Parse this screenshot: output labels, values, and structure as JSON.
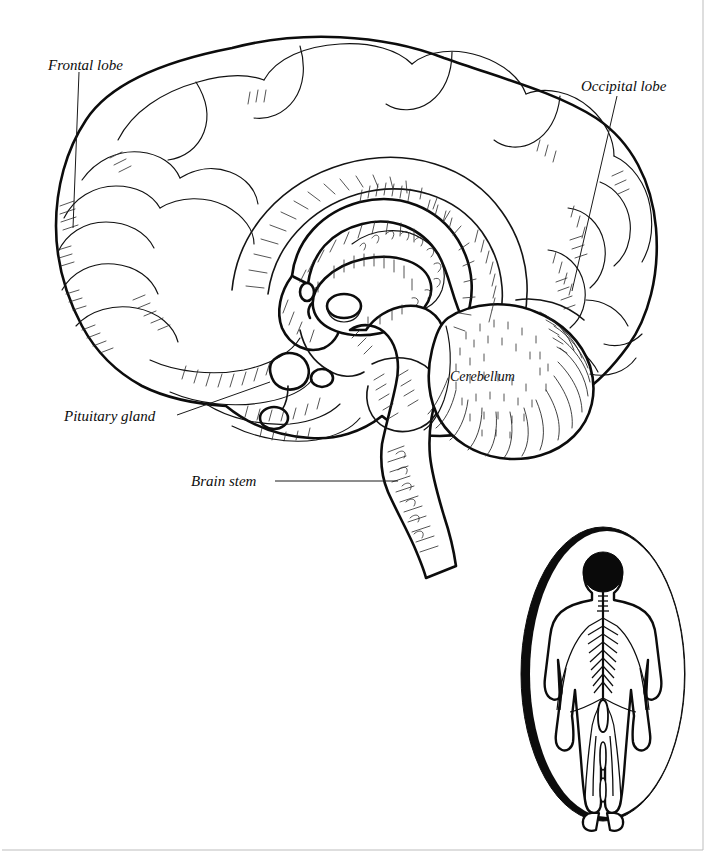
{
  "figure": {
    "background_color": "#ffffff",
    "ink_color": "#111111"
  },
  "labels": {
    "frontal_lobe": "Frontal lobe",
    "occipital_lobe": "Occipital lobe",
    "pituitary_gland": "Pituitary gland",
    "brain_stem": "Brain stem",
    "cerebellum": "Cerebellum"
  },
  "inset": {
    "name": "human-nervous-system-inset",
    "description": "Human figure showing brain and spinal cord inside an oval frame",
    "head_fill": "#0a0a0a"
  },
  "frame": {
    "bottom_rule": true,
    "right_rule": true,
    "rule_color": "#bdbdbd"
  }
}
